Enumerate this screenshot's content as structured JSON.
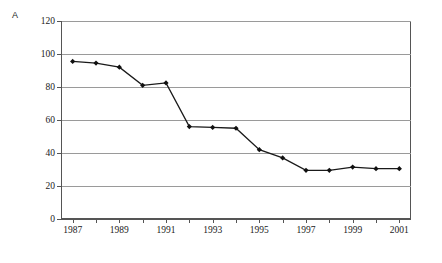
{
  "figure": {
    "panel_label": "A",
    "background": "#ffffff",
    "line_color": "#1a1a1a",
    "grid_color": "#9a9a9a"
  },
  "chart_data": {
    "type": "line",
    "title": "",
    "xlabel": "",
    "ylabel": "",
    "x": [
      1987,
      1988,
      1989,
      1990,
      1991,
      1992,
      1993,
      1994,
      1995,
      1996,
      1997,
      1998,
      1999,
      2000,
      2001
    ],
    "values": [
      95.5,
      94.5,
      92.0,
      81.0,
      82.5,
      56.0,
      55.5,
      55.0,
      42.0,
      37.0,
      29.5,
      29.5,
      31.5,
      30.5,
      30.5
    ],
    "series": [
      {
        "name": "A",
        "values": [
          95.5,
          94.5,
          92.0,
          81.0,
          82.5,
          56.0,
          55.5,
          55.0,
          42.0,
          37.0,
          29.5,
          29.5,
          31.5,
          30.5,
          30.5
        ]
      }
    ],
    "xlim": [
      1986.5,
      2001.5
    ],
    "ylim": [
      0,
      120
    ],
    "yticks": [
      0,
      20,
      40,
      60,
      80,
      100,
      120
    ],
    "ytick_labels": [
      "0",
      "20",
      "40",
      "60",
      "80",
      "100",
      "120"
    ],
    "xticks": [
      1987,
      1988,
      1989,
      1990,
      1991,
      1992,
      1993,
      1994,
      1995,
      1996,
      1997,
      1998,
      1999,
      2000,
      2001
    ],
    "xtick_labels_shown": [
      "1987",
      "1989",
      "1991",
      "1993",
      "1995",
      "1997",
      "1999",
      "2001"
    ],
    "grid": "horizontal",
    "legend": "none",
    "marker": "filled-diamond"
  }
}
